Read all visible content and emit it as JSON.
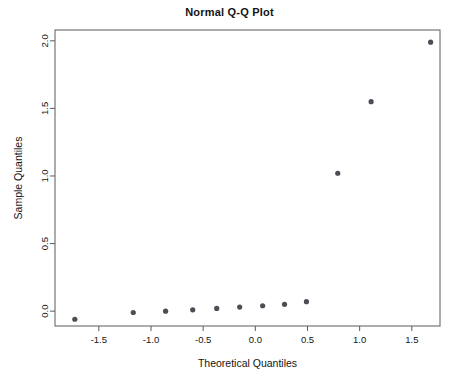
{
  "chart_data": {
    "type": "scatter",
    "title": "Normal Q-Q Plot",
    "xlabel": "Theoretical Quantiles",
    "ylabel": "Sample Quantiles",
    "xlim": [
      -1.92,
      1.77
    ],
    "ylim": [
      -0.11,
      2.08
    ],
    "grid": false,
    "legend": null,
    "xticks": [
      -1.5,
      -1.0,
      -0.5,
      0.0,
      0.5,
      1.0,
      1.5
    ],
    "xtick_labels": [
      "-1.5",
      "-1.0",
      "-0.5",
      "0.0",
      "0.5",
      "1.0",
      "1.5"
    ],
    "yticks": [
      0.0,
      0.5,
      1.0,
      1.5,
      2.0
    ],
    "ytick_labels": [
      "0.0",
      "0.5",
      "1.0",
      "1.5",
      "2.0"
    ],
    "point_color": "#4d4d55",
    "frame_color": "#5a5a5a",
    "series": [
      {
        "name": "sample quantiles",
        "x": [
          -1.73,
          -1.17,
          -0.86,
          -0.6,
          -0.37,
          -0.15,
          0.07,
          0.28,
          0.49,
          0.79,
          1.11,
          1.68
        ],
        "y": [
          -0.06,
          -0.01,
          0.0,
          0.01,
          0.02,
          0.03,
          0.04,
          0.05,
          0.07,
          1.02,
          1.55,
          1.99
        ]
      }
    ]
  }
}
